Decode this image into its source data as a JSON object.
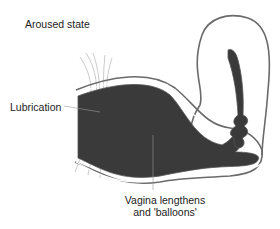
{
  "diagram": {
    "title": "Aroused state",
    "labels": {
      "lubrication": "Lubrication",
      "vagina_line1": "Vagina lengthens",
      "vagina_line2": "and 'balloons'"
    },
    "colors": {
      "tissue": "#3a3a3a",
      "outline": "#6a6a6a",
      "lubrication_lines": "#b0b0b0",
      "leader": "#999999"
    }
  }
}
